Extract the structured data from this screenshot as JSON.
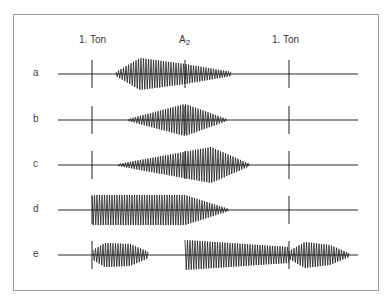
{
  "header": {
    "left_label": "1. Ton",
    "center_label_main": "A",
    "center_label_sub": "2",
    "right_label": "1. Ton"
  },
  "markers_x": {
    "left": 92,
    "center": 185,
    "right": 289
  },
  "baseline": {
    "x_start": 58,
    "x_end": 358
  },
  "rows": [
    {
      "label": "a",
      "y": 74,
      "show_center_marker": true,
      "segments": [
        {
          "env": [
            [
              116,
              2
            ],
            [
              140,
              16
            ],
            [
              185,
              10
            ],
            [
              232,
              2
            ]
          ]
        }
      ]
    },
    {
      "label": "b",
      "y": 120,
      "show_center_marker": true,
      "segments": [
        {
          "env": [
            [
              128,
              1
            ],
            [
              185,
              16
            ],
            [
              227,
              1
            ]
          ]
        }
      ]
    },
    {
      "label": "c",
      "y": 165,
      "show_center_marker": true,
      "segments": [
        {
          "env": [
            [
              118,
              1
            ],
            [
              211,
              18
            ],
            [
              250,
              1
            ]
          ]
        }
      ]
    },
    {
      "label": "d",
      "y": 210,
      "show_center_marker": false,
      "segments": [
        {
          "env": [
            [
              92,
              15
            ],
            [
              185,
              15
            ],
            [
              229,
              1
            ]
          ]
        }
      ]
    },
    {
      "label": "e",
      "y": 255,
      "show_center_marker": false,
      "segments": [
        {
          "env": [
            [
              93,
              5
            ],
            [
              105,
              12
            ],
            [
              130,
              11
            ],
            [
              149,
              3
            ]
          ]
        },
        {
          "env": [
            [
              185,
              15
            ],
            [
              289,
              8
            ]
          ]
        },
        {
          "env": [
            [
              289,
              4
            ],
            [
              305,
              13
            ],
            [
              330,
              10
            ],
            [
              349,
              2
            ]
          ]
        }
      ]
    }
  ],
  "colors": {
    "ink": "#1e1e1e",
    "frame": "#9a9a9a",
    "baseline": "#2a2a2a"
  }
}
